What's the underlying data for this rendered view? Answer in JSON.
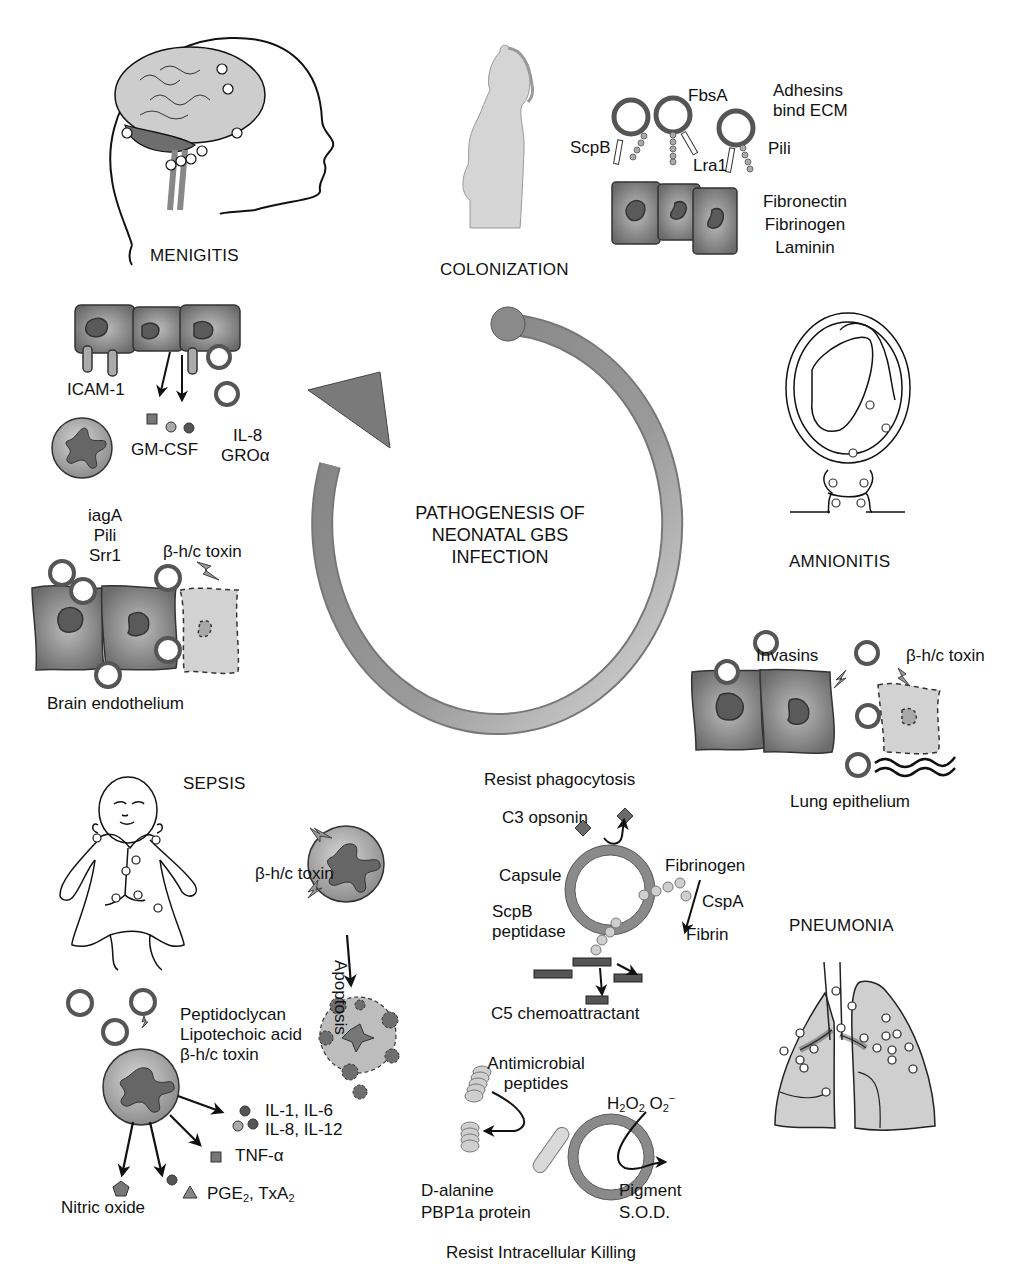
{
  "center": {
    "title_line1": "PATHOGENESIS OF",
    "title_line2": "NEONATAL GBS",
    "title_line3": "INFECTION"
  },
  "stages": {
    "menigitis": "MENIGITIS",
    "colonization": "COLONIZATION",
    "amnionitis": "AMNIONITIS",
    "sepsis": "SEPSIS",
    "pneumonia": "PNEUMONIA"
  },
  "colonization": {
    "adhesin_labels": [
      "ScpB",
      "FbsA",
      "Lra1",
      "Pili"
    ],
    "adhesins_note_line1": "Adhesins",
    "adhesins_note_line2": "bind ECM",
    "ecm": [
      "Fibronectin",
      "Fibrinogen",
      "Laminin"
    ]
  },
  "meningitis_panel": {
    "icam": "ICAM-1",
    "gmcsf": "GM-CSF",
    "il8": "IL-8",
    "gro": "GROα",
    "factors": [
      "iagA",
      "Pili",
      "Srr1"
    ],
    "toxin": "β-h/c toxin",
    "tissue": "Brain endothelium"
  },
  "lung_panel": {
    "invasins": "Invasins",
    "toxin": "β-h/c toxin",
    "tissue": "Lung epithelium"
  },
  "sepsis_panel": {
    "toxin": "β-h/c toxin",
    "apoptosis": "Apoptosis",
    "stimuli": [
      "Peptidoclycan",
      "Lipotechoic acid",
      "β-h/c toxin"
    ],
    "cytokines_line1": "IL-1, IL-6",
    "cytokines_line2": "IL-8, IL-12",
    "tnf": "TNF-α",
    "nitric_oxide": "Nitric oxide",
    "pge": "PGE",
    "pge_sub": "2",
    "txa_sep": ", TxA",
    "txa_sub": "2"
  },
  "phagocytosis": {
    "heading": "Resist phagocytosis",
    "c3": "C3 opsonin",
    "capsule": "Capsule",
    "fibrinogen": "Fibrinogen",
    "cspa": "CspA",
    "fibrin": "Fibrin",
    "scpb_line1": "ScpB",
    "scpb_line2": "peptidase",
    "c5": "C5 chemoattractant"
  },
  "intracellular": {
    "amp_line1": "Antimicrobial",
    "amp_line2": "peptides",
    "h2o2": "H",
    "h2o2_sub1": "2",
    "h2o2_mid": "O",
    "h2o2_sub2": "2",
    "o2": " O",
    "o2_sub": "2",
    "o2_sup": "−",
    "dalanine": "D-alanine",
    "pbp": "PBP1a protein",
    "pigment": "Pigment",
    "sod": "S.O.D.",
    "heading": "Resist Intracellular Killing"
  },
  "colors": {
    "cell_dark": "#6e6e6e",
    "cell_mid": "#9a9a9a",
    "nucleus": "#5a5a5a",
    "light_fill": "#cfcfcf",
    "ring_gray": "#8a8a8a",
    "line": "#111111"
  }
}
